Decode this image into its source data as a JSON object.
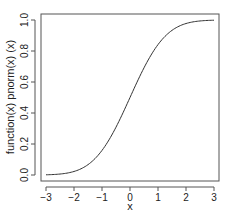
{
  "chart_data": {
    "type": "line",
    "title": "",
    "xlabel": "x",
    "ylabel": "function(x) pnorm(x) (x)",
    "xlim": [
      -3,
      3
    ],
    "ylim": [
      0,
      1
    ],
    "grid": false,
    "legend": null,
    "x_ticks": [
      -3,
      -2,
      -1,
      0,
      1,
      2,
      3
    ],
    "x_tick_labels": [
      "−3",
      "−2",
      "−1",
      "0",
      "1",
      "2",
      "3"
    ],
    "y_ticks": [
      0.0,
      0.2,
      0.4,
      0.6,
      0.8,
      1.0
    ],
    "y_tick_labels": [
      "0.0",
      "0.2",
      "0.4",
      "0.6",
      "0.8",
      "1.0"
    ],
    "series": [
      {
        "name": "pnorm(x)",
        "x": [
          -3,
          -2.5,
          -2,
          -1.5,
          -1,
          -0.5,
          0,
          0.5,
          1,
          1.5,
          2,
          2.5,
          3
        ],
        "values": [
          0.0013,
          0.0062,
          0.0228,
          0.0668,
          0.1587,
          0.3085,
          0.5,
          0.6915,
          0.8413,
          0.9332,
          0.9772,
          0.9938,
          0.9987
        ]
      }
    ],
    "colors": {
      "line": "#333333",
      "axis": "#555555",
      "text": "#222222"
    }
  }
}
